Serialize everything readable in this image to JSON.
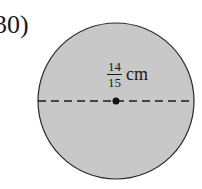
{
  "problem": {
    "number_label": "30)",
    "shape": "circle",
    "measurement": {
      "numerator": "14",
      "denominator": "15",
      "unit": "cm",
      "refers_to": "diameter"
    },
    "colors": {
      "fill": "#c8c8c8",
      "stroke": "#2a2a2a"
    }
  }
}
